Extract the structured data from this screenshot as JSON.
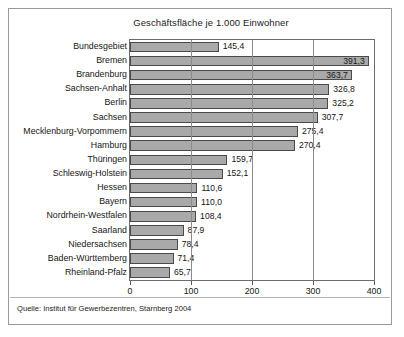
{
  "figure": {
    "title": "Geschäftsfläche je 1.000 Einwohner",
    "source": "Quelle: Institut für Gewerbezentren, Starnberg 2004"
  },
  "colors": {
    "bar_fill": "#a9a9a9",
    "bar_border": "#4a4a4a",
    "frame": "#9a9a9a",
    "plot_border": "#6b6b6b",
    "gridline": "#8c8c8c",
    "text": "#161616"
  },
  "chart_data": {
    "type": "bar",
    "orientation": "horizontal",
    "title": "Geschäftsfläche je 1.000 Einwohner",
    "xlabel": "",
    "ylabel": "",
    "xlim": [
      0,
      400
    ],
    "xticks": [
      0,
      100,
      200,
      300,
      400
    ],
    "xtick_labels": [
      "0",
      "100",
      "200",
      "300",
      "400"
    ],
    "grid": true,
    "legend": null,
    "decimal_separator": ",",
    "categories": [
      "Bundesgebiet",
      "Bremen",
      "Brandenburg",
      "Sachsen-Anhalt",
      "Berlin",
      "Sachsen",
      "Mecklenburg-Vorpommern",
      "Hamburg",
      "Thüringen",
      "Schleswig-Holstein",
      "Hessen",
      "Bayern",
      "Nordrhein-Westfalen",
      "Saarland",
      "Niedersachsen",
      "Baden-Württemberg",
      "Rheinland-Pfalz"
    ],
    "values": [
      145.4,
      391.3,
      363.7,
      326.8,
      325.2,
      307.7,
      275.4,
      270.4,
      159.7,
      152.1,
      110.6,
      110.0,
      108.4,
      87.9,
      78.4,
      71.4,
      65.7
    ],
    "value_labels": [
      "145,4",
      "391,3",
      "363,7",
      "326,8",
      "325,2",
      "307,7",
      "275,4",
      "270,4",
      "159,7",
      "152,1",
      "110,6",
      "110,0",
      "108,4",
      "87,9",
      "78,4",
      "71,4",
      "65,7"
    ],
    "label_placement": [
      "outside",
      "inside",
      "inside",
      "outside",
      "outside",
      "outside",
      "outside",
      "outside",
      "outside",
      "outside",
      "outside",
      "outside",
      "outside",
      "outside",
      "outside",
      "outside",
      "outside"
    ]
  }
}
